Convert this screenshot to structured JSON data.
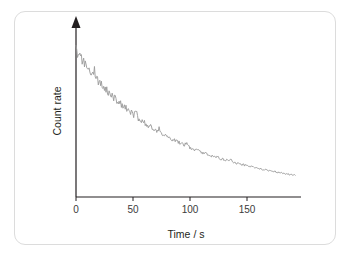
{
  "figure": {
    "background_color": "#ffffff",
    "border_color": "#dcdcdc",
    "curve_color": "#9a9a9a",
    "axis_color": "#231f20"
  },
  "chart_data": {
    "type": "line",
    "title": "",
    "xlabel": "Time / s",
    "ylabel": "Count rate",
    "xlim": [
      0,
      195
    ],
    "ylim": [
      0,
      110
    ],
    "grid": false,
    "legend": null,
    "x_ticks": [
      0,
      50,
      100,
      150
    ],
    "x_tick_labels": [
      "0",
      "50",
      "100",
      "150"
    ],
    "y_ticks": [],
    "y_tick_labels": [],
    "y_axis_arrow": true,
    "series": [
      {
        "name": "Count rate",
        "color": "#9a9a9a",
        "half_life": 55,
        "initial_value": 100,
        "x": [
          0,
          2,
          4,
          6,
          8,
          10,
          12,
          14,
          16,
          18,
          20,
          22,
          24,
          26,
          28,
          30,
          32,
          34,
          36,
          38,
          40,
          42,
          44,
          46,
          48,
          50,
          52,
          54,
          56,
          58,
          60,
          62,
          64,
          66,
          68,
          70,
          72,
          74,
          76,
          78,
          80,
          82,
          84,
          86,
          88,
          90,
          92,
          94,
          96,
          98,
          100,
          102,
          104,
          106,
          108,
          110,
          112,
          114,
          116,
          118,
          120,
          122,
          124,
          126,
          128,
          130,
          132,
          134,
          136,
          138,
          140,
          142,
          144,
          146,
          148,
          150,
          152,
          154,
          156,
          158,
          160,
          162,
          164,
          166,
          168,
          170,
          172,
          174,
          176,
          178,
          180,
          182,
          184,
          186,
          188,
          190
        ],
        "values": [
          100.0,
          96.8,
          95.1,
          92.0,
          91.4,
          87.6,
          86.9,
          83.2,
          86.0,
          80.1,
          78.4,
          77.9,
          74.2,
          73.8,
          71.0,
          70.4,
          67.9,
          67.2,
          65.0,
          64.1,
          62.5,
          60.8,
          60.2,
          58.0,
          57.4,
          55.9,
          58.2,
          53.0,
          52.4,
          50.9,
          50.2,
          48.8,
          48.1,
          46.9,
          46.2,
          45.0,
          46.8,
          43.2,
          42.4,
          41.8,
          40.6,
          40.0,
          38.9,
          38.3,
          37.4,
          36.7,
          35.9,
          35.2,
          36.9,
          33.8,
          33.2,
          32.6,
          32.0,
          31.4,
          30.8,
          30.2,
          29.7,
          29.1,
          28.6,
          28.0,
          27.5,
          27.0,
          26.5,
          26.0,
          25.6,
          25.1,
          24.6,
          26.0,
          23.8,
          23.3,
          22.9,
          22.5,
          22.1,
          21.7,
          21.3,
          20.9,
          20.6,
          20.2,
          19.8,
          19.5,
          19.1,
          18.8,
          18.5,
          18.1,
          17.8,
          17.5,
          17.2,
          16.9,
          16.6,
          16.3,
          16.1,
          15.8,
          15.5,
          15.3,
          15.0,
          14.8
        ]
      }
    ]
  }
}
